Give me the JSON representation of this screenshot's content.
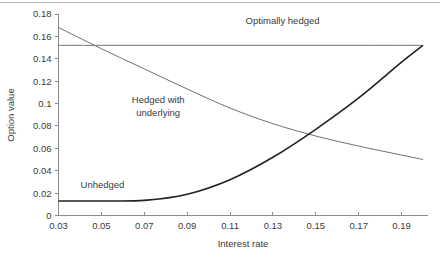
{
  "chart_data": {
    "type": "line",
    "title": "",
    "xlabel": "Interest rate",
    "ylabel": "Option value",
    "xlim": [
      0.03,
      0.2
    ],
    "ylim": [
      0,
      0.18
    ],
    "grid": false,
    "legend": "inline-annotations",
    "xticks": [
      "0.03",
      "0.05",
      "0.07",
      "0.09",
      "0.11",
      "0.13",
      "0.15",
      "0.17",
      "0.19"
    ],
    "xtick_values": [
      0.03,
      0.05,
      0.07,
      0.09,
      0.11,
      0.13,
      0.15,
      0.17,
      0.19
    ],
    "yticks": [
      "0",
      "0.02",
      "0.04",
      "0.06",
      "0.08",
      "0.1",
      "0.12",
      "0.14",
      "0.16",
      "0.18"
    ],
    "ytick_values": [
      0,
      0.02,
      0.04,
      0.06,
      0.08,
      0.1,
      0.12,
      0.14,
      0.16,
      0.18
    ],
    "series": [
      {
        "name": "Optimally hedged",
        "style": "flat",
        "color": "#707070",
        "width": 1,
        "x": [
          0.03,
          0.05,
          0.07,
          0.09,
          0.11,
          0.13,
          0.15,
          0.17,
          0.19,
          0.2
        ],
        "values": [
          0.152,
          0.152,
          0.152,
          0.152,
          0.152,
          0.152,
          0.152,
          0.152,
          0.152,
          0.152
        ]
      },
      {
        "name": "Hedged with underlying",
        "style": "declining",
        "color": "#707070",
        "width": 1,
        "x": [
          0.03,
          0.05,
          0.07,
          0.09,
          0.11,
          0.13,
          0.15,
          0.17,
          0.19,
          0.2
        ],
        "values": [
          0.168,
          0.149,
          0.131,
          0.113,
          0.096,
          0.082,
          0.071,
          0.062,
          0.054,
          0.05
        ]
      },
      {
        "name": "Unhedged",
        "style": "rising",
        "color": "#222222",
        "width": 1.6,
        "x": [
          0.03,
          0.05,
          0.07,
          0.09,
          0.11,
          0.13,
          0.15,
          0.17,
          0.19,
          0.2
        ],
        "values": [
          0.013,
          0.013,
          0.0135,
          0.019,
          0.032,
          0.052,
          0.077,
          0.105,
          0.137,
          0.152
        ]
      }
    ],
    "annotations": [
      {
        "text": "Optimally hedged",
        "x": 0.1345,
        "y": 0.1715,
        "anchor": "middle"
      },
      {
        "text": "Hedged with",
        "x": 0.0765,
        "y": 0.1005,
        "anchor": "middle"
      },
      {
        "text": "underlying",
        "x": 0.0765,
        "y": 0.0893,
        "anchor": "middle"
      },
      {
        "text": "Unhedged",
        "x": 0.0505,
        "y": 0.0248,
        "anchor": "middle"
      }
    ]
  }
}
